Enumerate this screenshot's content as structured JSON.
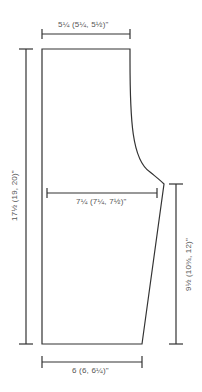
{
  "diagram": {
    "type": "knitting-schematic",
    "line_color": "#333333",
    "text_color": "#555555",
    "labels": {
      "top_width": "5¼ (5¼, 5½)\"",
      "mid_width": "7¼ (7¼, 7½)\"",
      "bottom_width": "6 (6, 6¼)\"",
      "total_length": "17½ (19, 20)\"",
      "lower_length": "9½ (10¾, 12)\""
    }
  }
}
